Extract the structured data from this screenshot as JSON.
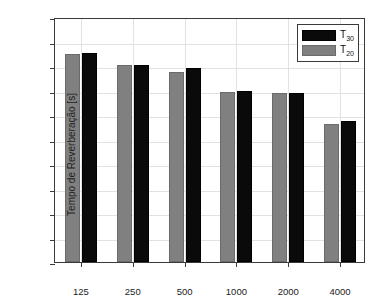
{
  "chart_data": {
    "type": "bar",
    "title": "",
    "xlabel": "Frequência [Hz]",
    "ylabel": "Tempo de Reverberação [s]",
    "categories": [
      "125",
      "250",
      "500",
      "1000",
      "2000",
      "4000"
    ],
    "series": [
      {
        "name": "T30",
        "label_base": "T",
        "label_sub": "30",
        "color": "#0a0a0a",
        "values": [
          1.71,
          1.61,
          1.58,
          1.4,
          1.38,
          1.15
        ]
      },
      {
        "name": "T20",
        "label_base": "T",
        "label_sub": "20",
        "color": "#808080",
        "values": [
          1.7,
          1.61,
          1.55,
          1.39,
          1.38,
          1.13
        ]
      }
    ],
    "ylim": [
      0.0,
      2.0
    ],
    "yticks": [
      "0.0",
      "0.2",
      "0.4",
      "0.6",
      "0.8",
      "1.0",
      "1.2",
      "1.4",
      "1.6",
      "1.8",
      "2.0"
    ],
    "ytick_values": [
      0.0,
      0.2,
      0.4,
      0.6,
      0.8,
      1.0,
      1.2,
      1.4,
      1.6,
      1.8,
      2.0
    ],
    "grid": true,
    "legend_position": "top-right",
    "bar_draw_order": [
      "T20",
      "T30"
    ]
  },
  "axes": {
    "x_title": "Frequência [Hz]",
    "y_title": "Tempo de Reverberação [s]"
  },
  "legend": {
    "entries": [
      {
        "base": "T",
        "sub": "30"
      },
      {
        "base": "T",
        "sub": "20"
      }
    ]
  }
}
